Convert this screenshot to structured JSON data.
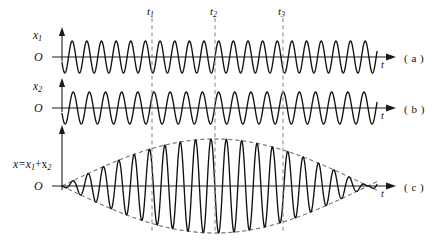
{
  "figure": {
    "background_color": "#ffffff",
    "wave_color": "#111111",
    "axis_color": "#1a1a1a",
    "marker_color": "#8d8d8d",
    "envelope_color": "#2b2b2b",
    "width": 443,
    "height": 246
  },
  "axis_labels": {
    "time_axis": "t",
    "origin": "O"
  },
  "panels": [
    {
      "id": "a",
      "panel_label": "( a )",
      "y_label_main": "x",
      "y_label_sub": "1",
      "origin_label": "O",
      "time_label": "t",
      "baseline_y": 57,
      "x_start": 62,
      "x_end": 377,
      "amplitude": 16,
      "cycles": 21.5,
      "phase_deg": 200
    },
    {
      "id": "b",
      "panel_label": "( b )",
      "y_label_main": "x",
      "y_label_sub": "2",
      "origin_label": "O",
      "time_label": "t",
      "baseline_y": 108,
      "x_start": 62,
      "x_end": 377,
      "amplitude": 16,
      "cycles": 19.5,
      "phase_deg": 200
    },
    {
      "id": "c",
      "panel_label": "( c )",
      "y_label_main": "x=x",
      "y_label_sub": "1",
      "y_label_op": "+x",
      "y_label_sub2": "2",
      "origin_label": "O",
      "time_label": "t",
      "baseline_y": 186,
      "x_start": 62,
      "x_end": 377,
      "amplitude": 47,
      "cycles": 20.5,
      "beat_cycles": 1.0,
      "phase_deg": 200,
      "envelope": true
    }
  ],
  "markers": [
    {
      "id": "t1",
      "label_main": "t",
      "label_sub": "1",
      "x": 152,
      "y_top": 18,
      "y_bottom": 232
    },
    {
      "id": "t2",
      "label_main": "t",
      "label_sub": "2",
      "x": 215,
      "y_top": 18,
      "y_bottom": 232
    },
    {
      "id": "t3",
      "label_main": "t",
      "label_sub": "3",
      "x": 283,
      "y_top": 18,
      "y_bottom": 232
    }
  ],
  "chart_data": {
    "type": "line",
    "xlabel": "t",
    "ylabel": "x",
    "grid": false,
    "legend": "none",
    "annotations": [
      "t1",
      "t2",
      "t3"
    ],
    "series": [
      {
        "name": "x1",
        "panel": "a",
        "description": "First harmonic oscillation, higher frequency",
        "amplitude": 1.0,
        "cycles_over_span": 21.5,
        "phase_deg": 200
      },
      {
        "name": "x2",
        "panel": "b",
        "description": "Second harmonic oscillation, slightly lower frequency",
        "amplitude": 1.0,
        "cycles_over_span": 19.5,
        "phase_deg": 200
      },
      {
        "name": "x=x1+x2",
        "panel": "c",
        "description": "Resultant showing beat envelope with node at t2",
        "amplitude": 2.0,
        "cycles_over_span": 20.5,
        "beat_cycles_over_span": 1.0,
        "phase_deg": 200
      }
    ]
  }
}
